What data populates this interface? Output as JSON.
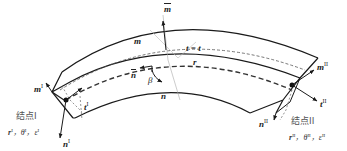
{
  "diagram": {
    "type": "curved-beam-element",
    "labels": {
      "m": "m",
      "m_bar": "m",
      "t_eq_tbar": "t = t",
      "r": "r",
      "n_bar": "n",
      "beta": "β",
      "n": "n",
      "m_I": "m",
      "t_I": "t",
      "n_I": "n",
      "m_II": "m",
      "t_II": "t",
      "n_II": "n",
      "sup_I": "I",
      "sup_II": "II"
    },
    "nodes": [
      {
        "title": "结点I",
        "vars": [
          "r",
          "θ",
          "ε"
        ],
        "sup": "I",
        "sep": "，"
      },
      {
        "title": "结点II",
        "vars": [
          "r",
          "θ",
          "ε"
        ],
        "sup": "II",
        "sep": "，"
      }
    ],
    "colors": {
      "stroke": "#1a1a1a",
      "dashed": "#444444",
      "text": "#222222",
      "node_title": "#555555"
    }
  }
}
